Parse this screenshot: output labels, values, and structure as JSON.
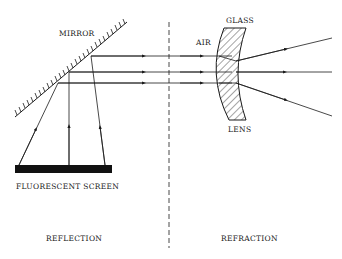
{
  "diagram": {
    "type": "optics-illustration",
    "left_panel": {
      "caption": "REFLECTION",
      "mirror_label": "MIRROR",
      "screen_label": "FLUORESCENT SCREEN"
    },
    "right_panel": {
      "caption": "REFRACTION",
      "medium_label": "AIR",
      "material_label": "GLASS",
      "element_label": "LENS"
    },
    "colors": {
      "ink": "#1a1a1a",
      "background": "#ffffff"
    }
  }
}
